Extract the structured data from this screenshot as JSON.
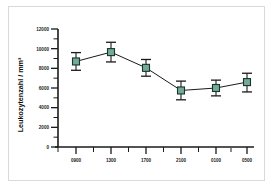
{
  "chart_data": {
    "type": "line",
    "title": "",
    "xlabel": "",
    "ylabel": "Leukozytenzahl / mm³",
    "ylim": [
      0,
      12000
    ],
    "ytick_labels": [
      "0",
      "2000",
      "4000",
      "6000",
      "8000",
      "10000",
      "12000"
    ],
    "ytick_values": [
      0,
      2000,
      4000,
      6000,
      8000,
      10000,
      12000
    ],
    "yminor_step": 1000,
    "grid": false,
    "legend": "none",
    "categories": [
      "0900",
      "1300",
      "1700",
      "2100",
      "0100",
      "0500"
    ],
    "x": [
      "0900",
      "1300",
      "1700",
      "2100",
      "0100",
      "0500"
    ],
    "values": [
      8700,
      9650,
      8050,
      5750,
      6000,
      6600
    ],
    "error_lower": [
      900,
      1000,
      850,
      950,
      800,
      1000
    ],
    "error_upper": [
      900,
      1000,
      850,
      950,
      800,
      900
    ],
    "marker": "square",
    "marker_color": "#76aa95",
    "marker_edge_color": "#16352b",
    "line_color": "#1a1a1a",
    "series": [
      {
        "name": "Leukozytenzahl",
        "values": [
          8700,
          9650,
          8050,
          5750,
          6000,
          6600
        ]
      }
    ]
  },
  "figure": {
    "background_color": "#ffffff",
    "frame_color": "#d9d9d9"
  }
}
